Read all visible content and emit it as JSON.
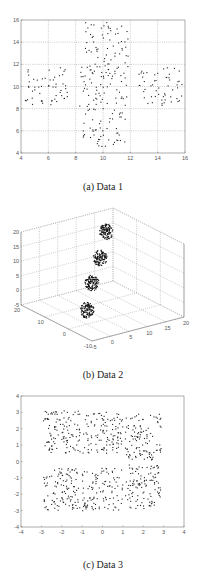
{
  "figure": {
    "captions": [
      "(a) Data 1",
      "(b) Data 2",
      "(c) Data 3"
    ]
  },
  "chart_data": [
    {
      "type": "scatter",
      "title": "(a) Data 1",
      "xlabel": "",
      "ylabel": "",
      "xlim": [
        4,
        16
      ],
      "ylim": [
        4,
        16
      ],
      "xticks": [
        4,
        6,
        8,
        10,
        12,
        14,
        16
      ],
      "yticks": [
        4,
        6,
        8,
        10,
        12,
        14,
        16
      ],
      "grid": true,
      "marker_color": "#222222",
      "clusters": [
        {
          "name": "center",
          "cx": 10,
          "cy": 10,
          "rx": 1.8,
          "ry": 1.8,
          "n": 70
        },
        {
          "name": "top",
          "cx": 10.3,
          "cy": 13.8,
          "rx": 1.6,
          "ry": 2.0,
          "n": 60
        },
        {
          "name": "bottom",
          "cx": 10.1,
          "cy": 6.3,
          "rx": 1.6,
          "ry": 1.8,
          "n": 55
        },
        {
          "name": "left",
          "cx": 5.8,
          "cy": 10.0,
          "rx": 1.6,
          "ry": 1.7,
          "n": 55
        },
        {
          "name": "right",
          "cx": 14.2,
          "cy": 10.0,
          "rx": 1.6,
          "ry": 1.7,
          "n": 55
        }
      ]
    },
    {
      "type": "scatter3d",
      "title": "(b) Data 2",
      "xlim": [
        -5,
        20
      ],
      "ylim": [
        -10,
        20
      ],
      "zlim": [
        -5,
        20
      ],
      "xticks": [
        -5,
        0,
        5,
        10,
        15,
        20
      ],
      "yticks": [
        -10,
        0,
        10,
        20
      ],
      "zticks": [
        -5,
        0,
        5,
        10,
        15,
        20
      ],
      "grid": true,
      "marker_color": "#111111",
      "clusters": [
        {
          "name": "c1",
          "x": 5,
          "y": 5,
          "z": 17,
          "r": 2.5,
          "n": 120
        },
        {
          "name": "c2",
          "x": 5,
          "y": 5,
          "z": 11,
          "r": 2.5,
          "n": 120
        },
        {
          "name": "c3",
          "x": 5,
          "y": 5,
          "z": 5,
          "r": 2.5,
          "n": 120
        },
        {
          "name": "c4",
          "x": 5,
          "y": 5,
          "z": -1,
          "r": 2.5,
          "n": 120
        }
      ]
    },
    {
      "type": "scatter",
      "title": "(c) Data 3",
      "xlabel": "",
      "ylabel": "",
      "xlim": [
        -4,
        4
      ],
      "ylim": [
        -4,
        4
      ],
      "xticks": [
        -4,
        -3,
        -2,
        -1,
        0,
        1,
        2,
        3,
        4
      ],
      "yticks": [
        -4,
        -3,
        -2,
        -1,
        0,
        1,
        2,
        3,
        4
      ],
      "grid": false,
      "marker_color": "#222222",
      "clusters": [
        {
          "name": "top-left",
          "cx": -2,
          "cy": 1.8,
          "rx": 0.9,
          "ry": 1.3,
          "n": 110
        },
        {
          "name": "top-mid",
          "cx": 0,
          "cy": 1.8,
          "rx": 1.0,
          "ry": 1.3,
          "n": 110
        },
        {
          "name": "top-right",
          "cx": 2,
          "cy": 1.5,
          "rx": 0.9,
          "ry": 1.4,
          "n": 110
        },
        {
          "name": "bot-left",
          "cx": -2,
          "cy": -1.7,
          "rx": 0.9,
          "ry": 1.3,
          "n": 110
        },
        {
          "name": "bot-mid",
          "cx": 0,
          "cy": -1.7,
          "rx": 1.0,
          "ry": 1.3,
          "n": 110
        },
        {
          "name": "bot-right",
          "cx": 2,
          "cy": -1.6,
          "rx": 0.9,
          "ry": 1.4,
          "n": 110
        }
      ]
    }
  ]
}
